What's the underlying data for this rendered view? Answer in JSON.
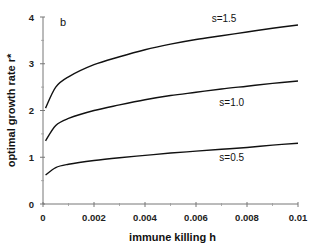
{
  "chart_data": {
    "type": "line",
    "title": "",
    "panel_label": "b",
    "xlabel": "immune killing h",
    "ylabel": "optimal growth rate r*",
    "xlim": [
      0,
      0.01
    ],
    "ylim": [
      0,
      4
    ],
    "xticks": [
      0,
      0.002,
      0.004,
      0.006,
      0.008,
      0.01
    ],
    "xtick_labels": [
      "0",
      "0.002",
      "0.004",
      "0.006",
      "0.008",
      "0.01"
    ],
    "yticks": [
      0,
      1,
      2,
      3,
      4
    ],
    "ytick_labels": [
      "0",
      "1",
      "2",
      "3",
      "4"
    ],
    "grid": false,
    "legend": "inline labels",
    "x": [
      0.0001,
      0.0005,
      0.001,
      0.002,
      0.003,
      0.004,
      0.005,
      0.006,
      0.007,
      0.008,
      0.009,
      0.01
    ],
    "series": [
      {
        "name": "s=1.5",
        "values": [
          2.05,
          2.5,
          2.72,
          2.98,
          3.15,
          3.3,
          3.42,
          3.52,
          3.6,
          3.68,
          3.76,
          3.83
        ]
      },
      {
        "name": "s=1.0",
        "values": [
          1.35,
          1.68,
          1.83,
          2.0,
          2.12,
          2.23,
          2.32,
          2.39,
          2.46,
          2.52,
          2.58,
          2.63
        ]
      },
      {
        "name": "s=0.5",
        "values": [
          0.62,
          0.78,
          0.85,
          0.93,
          0.99,
          1.04,
          1.09,
          1.13,
          1.17,
          1.21,
          1.26,
          1.3
        ]
      }
    ],
    "series_label_positions": [
      {
        "name": "s=1.5",
        "h": 0.0071,
        "r": 3.95
      },
      {
        "name": "s=1.0",
        "h": 0.0074,
        "r": 2.15
      },
      {
        "name": "s=0.5",
        "h": 0.0074,
        "r": 0.98
      }
    ]
  }
}
